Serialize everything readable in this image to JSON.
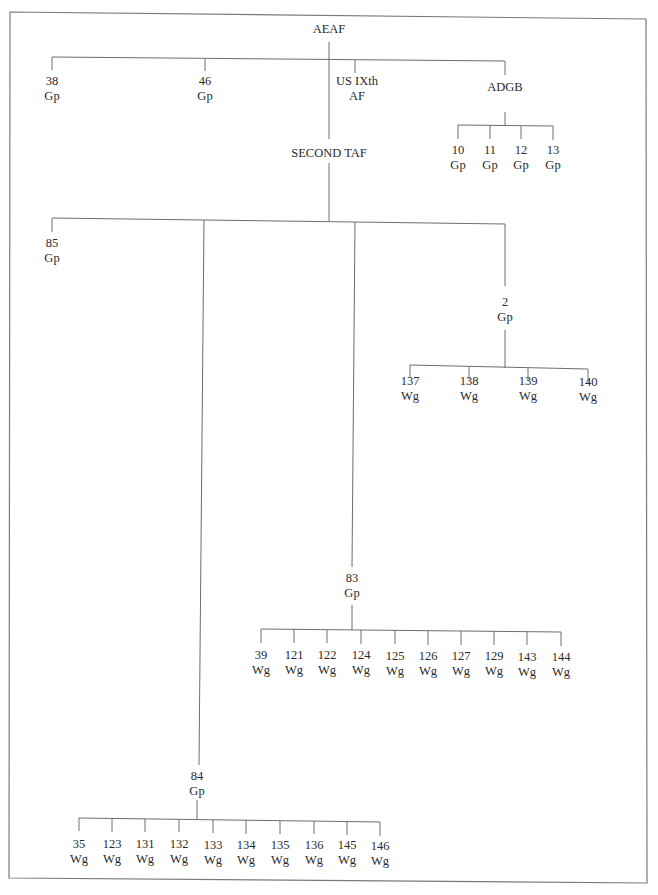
{
  "diagram": {
    "type": "organization-chart",
    "root": {
      "id": "aeaf",
      "lines": [
        "AEAF"
      ],
      "x": 329,
      "y": 22,
      "children": [
        {
          "id": "38-gp",
          "lines": [
            "38",
            "Gp"
          ],
          "x": 52,
          "y": 74
        },
        {
          "id": "46-gp",
          "lines": [
            "46",
            "Gp"
          ],
          "x": 205,
          "y": 74
        },
        {
          "id": "us-ixth-af",
          "lines": [
            "US IXth",
            "AF"
          ],
          "x": 357,
          "y": 74
        },
        {
          "id": "adgb",
          "lines": [
            "ADGB"
          ],
          "x": 505,
          "y": 80,
          "children": [
            {
              "id": "10-gp",
              "lines": [
                "10",
                "Gp"
              ],
              "x": 458,
              "y": 143
            },
            {
              "id": "11-gp",
              "lines": [
                "11",
                "Gp"
              ],
              "x": 490,
              "y": 143
            },
            {
              "id": "12-gp",
              "lines": [
                "12",
                "Gp"
              ],
              "x": 521,
              "y": 143
            },
            {
              "id": "13-gp",
              "lines": [
                "13",
                "Gp"
              ],
              "x": 553,
              "y": 143
            }
          ]
        },
        {
          "id": "second-taf",
          "lines": [
            "SECOND TAF"
          ],
          "x": 329,
          "y": 146,
          "children": [
            {
              "id": "85-gp",
              "lines": [
                "85",
                "Gp"
              ],
              "x": 52,
              "y": 236
            },
            {
              "id": "2-gp",
              "lines": [
                "2",
                "Gp"
              ],
              "x": 505,
              "y": 295,
              "children": [
                {
                  "id": "137-wg",
                  "lines": [
                    "137",
                    "Wg"
                  ],
                  "x": 410,
                  "y": 374
                },
                {
                  "id": "138-wg",
                  "lines": [
                    "138",
                    "Wg"
                  ],
                  "x": 469,
                  "y": 374
                },
                {
                  "id": "139-wg",
                  "lines": [
                    "139",
                    "Wg"
                  ],
                  "x": 528,
                  "y": 374
                },
                {
                  "id": "140-wg",
                  "lines": [
                    "140",
                    "Wg"
                  ],
                  "x": 588,
                  "y": 375
                }
              ]
            },
            {
              "id": "83-gp",
              "lines": [
                "83",
                "Gp"
              ],
              "x": 352,
              "y": 571,
              "children": [
                {
                  "id": "39-wg",
                  "lines": [
                    "39",
                    "Wg"
                  ],
                  "x": 261,
                  "y": 648
                },
                {
                  "id": "121-wg",
                  "lines": [
                    "121",
                    "Wg"
                  ],
                  "x": 294,
                  "y": 648
                },
                {
                  "id": "122-wg",
                  "lines": [
                    "122",
                    "Wg"
                  ],
                  "x": 327,
                  "y": 648
                },
                {
                  "id": "124-wg",
                  "lines": [
                    "124",
                    "Wg"
                  ],
                  "x": 361,
                  "y": 648
                },
                {
                  "id": "125-wg",
                  "lines": [
                    "125",
                    "Wg"
                  ],
                  "x": 395,
                  "y": 649
                },
                {
                  "id": "126-wg",
                  "lines": [
                    "126",
                    "Wg"
                  ],
                  "x": 428,
                  "y": 649
                },
                {
                  "id": "127-wg",
                  "lines": [
                    "127",
                    "Wg"
                  ],
                  "x": 461,
                  "y": 649
                },
                {
                  "id": "129-wg",
                  "lines": [
                    "129",
                    "Wg"
                  ],
                  "x": 494,
                  "y": 649
                },
                {
                  "id": "143-wg",
                  "lines": [
                    "143",
                    "Wg"
                  ],
                  "x": 527,
                  "y": 650
                },
                {
                  "id": "144-wg",
                  "lines": [
                    "144",
                    "Wg"
                  ],
                  "x": 561,
                  "y": 650
                }
              ]
            },
            {
              "id": "84-gp",
              "lines": [
                "84",
                "Gp"
              ],
              "x": 197,
              "y": 769,
              "children": [
                {
                  "id": "35-wg",
                  "lines": [
                    "35",
                    "Wg"
                  ],
                  "x": 79,
                  "y": 837
                },
                {
                  "id": "123-wg",
                  "lines": [
                    "123",
                    "Wg"
                  ],
                  "x": 112,
                  "y": 837
                },
                {
                  "id": "131-wg",
                  "lines": [
                    "131",
                    "Wg"
                  ],
                  "x": 145,
                  "y": 837
                },
                {
                  "id": "132-wg",
                  "lines": [
                    "132",
                    "Wg"
                  ],
                  "x": 179,
                  "y": 837
                },
                {
                  "id": "133-wg",
                  "lines": [
                    "133",
                    "Wg"
                  ],
                  "x": 213,
                  "y": 838
                },
                {
                  "id": "134-wg",
                  "lines": [
                    "134",
                    "Wg"
                  ],
                  "x": 246,
                  "y": 838
                },
                {
                  "id": "135-wg",
                  "lines": [
                    "135",
                    "Wg"
                  ],
                  "x": 280,
                  "y": 838
                },
                {
                  "id": "136-wg",
                  "lines": [
                    "136",
                    "Wg"
                  ],
                  "x": 314,
                  "y": 838
                },
                {
                  "id": "145-wg",
                  "lines": [
                    "145",
                    "Wg"
                  ],
                  "x": 347,
                  "y": 838
                },
                {
                  "id": "146-wg",
                  "lines": [
                    "146",
                    "Wg"
                  ],
                  "x": 380,
                  "y": 839
                }
              ]
            }
          ]
        }
      ]
    },
    "connectors": [
      {
        "name": "aeaf-to-second-taf-trunk",
        "x1": 329,
        "y1": 42,
        "x2": 329,
        "y2": 139
      },
      {
        "name": "aeaf-children-bar",
        "x1": 52,
        "y1": 57,
        "x2": 505,
        "y2": 61
      },
      {
        "name": "tick-38-gp",
        "x1": 52,
        "y1": 57,
        "x2": 52,
        "y2": 70
      },
      {
        "name": "tick-46-gp",
        "x1": 205,
        "y1": 58,
        "x2": 205,
        "y2": 71
      },
      {
        "name": "tick-us-ixth-af",
        "x1": 355,
        "y1": 60,
        "x2": 355,
        "y2": 73
      },
      {
        "name": "tick-adgb",
        "x1": 505,
        "y1": 61,
        "x2": 505,
        "y2": 75
      },
      {
        "name": "adgb-stem",
        "x1": 505,
        "y1": 112,
        "x2": 505,
        "y2": 126
      },
      {
        "name": "adgb-children-bar",
        "x1": 458,
        "y1": 125,
        "x2": 553,
        "y2": 126
      },
      {
        "name": "tick-10-gp",
        "x1": 458,
        "y1": 125,
        "x2": 458,
        "y2": 139
      },
      {
        "name": "tick-11-gp",
        "x1": 490,
        "y1": 125,
        "x2": 490,
        "y2": 139
      },
      {
        "name": "tick-12-gp",
        "x1": 521,
        "y1": 126,
        "x2": 521,
        "y2": 139
      },
      {
        "name": "tick-13-gp",
        "x1": 553,
        "y1": 126,
        "x2": 553,
        "y2": 140
      },
      {
        "name": "second-taf-stem",
        "x1": 329,
        "y1": 163,
        "x2": 329,
        "y2": 221
      },
      {
        "name": "second-taf-children-bar",
        "x1": 52,
        "y1": 218,
        "x2": 505,
        "y2": 224
      },
      {
        "name": "tick-85-gp",
        "x1": 52,
        "y1": 218,
        "x2": 52,
        "y2": 232
      },
      {
        "name": "line-to-84-gp",
        "x1": 204,
        "y1": 220,
        "x2": 199,
        "y2": 765
      },
      {
        "name": "line-to-83-gp",
        "x1": 355,
        "y1": 222,
        "x2": 352,
        "y2": 567
      },
      {
        "name": "tick-2-gp",
        "x1": 505,
        "y1": 224,
        "x2": 505,
        "y2": 286
      },
      {
        "name": "2-gp-stem",
        "x1": 505,
        "y1": 330,
        "x2": 505,
        "y2": 368
      },
      {
        "name": "2-gp-children-bar",
        "x1": 410,
        "y1": 365,
        "x2": 588,
        "y2": 369
      },
      {
        "name": "tick-137-wg",
        "x1": 410,
        "y1": 365,
        "x2": 410,
        "y2": 378
      },
      {
        "name": "tick-138-wg",
        "x1": 469,
        "y1": 366,
        "x2": 469,
        "y2": 379
      },
      {
        "name": "tick-139-wg",
        "x1": 528,
        "y1": 368,
        "x2": 528,
        "y2": 381
      },
      {
        "name": "tick-140-wg",
        "x1": 588,
        "y1": 369,
        "x2": 588,
        "y2": 383
      },
      {
        "name": "83-gp-stem",
        "x1": 352,
        "y1": 605,
        "x2": 352,
        "y2": 630
      },
      {
        "name": "83-gp-children-bar",
        "x1": 261,
        "y1": 629,
        "x2": 561,
        "y2": 632
      },
      {
        "name": "tick-39-wg",
        "x1": 261,
        "y1": 629,
        "x2": 261,
        "y2": 643
      },
      {
        "name": "tick-121-wg",
        "x1": 294,
        "y1": 629,
        "x2": 294,
        "y2": 643
      },
      {
        "name": "tick-122-wg",
        "x1": 327,
        "y1": 630,
        "x2": 327,
        "y2": 643
      },
      {
        "name": "tick-124-wg",
        "x1": 361,
        "y1": 630,
        "x2": 361,
        "y2": 644
      },
      {
        "name": "tick-125-wg",
        "x1": 395,
        "y1": 630,
        "x2": 395,
        "y2": 644
      },
      {
        "name": "tick-126-wg",
        "x1": 428,
        "y1": 631,
        "x2": 428,
        "y2": 645
      },
      {
        "name": "tick-127-wg",
        "x1": 461,
        "y1": 631,
        "x2": 461,
        "y2": 645
      },
      {
        "name": "tick-129-wg",
        "x1": 494,
        "y1": 631,
        "x2": 494,
        "y2": 645
      },
      {
        "name": "tick-143-wg",
        "x1": 527,
        "y1": 632,
        "x2": 527,
        "y2": 645
      },
      {
        "name": "tick-144-wg",
        "x1": 561,
        "y1": 632,
        "x2": 561,
        "y2": 646
      },
      {
        "name": "84-gp-stem",
        "x1": 197,
        "y1": 800,
        "x2": 197,
        "y2": 820
      },
      {
        "name": "84-gp-children-bar",
        "x1": 79,
        "y1": 818,
        "x2": 380,
        "y2": 822
      },
      {
        "name": "tick-35-wg",
        "x1": 79,
        "y1": 818,
        "x2": 79,
        "y2": 831
      },
      {
        "name": "tick-123-wg",
        "x1": 112,
        "y1": 819,
        "x2": 112,
        "y2": 832
      },
      {
        "name": "tick-131-wg",
        "x1": 145,
        "y1": 819,
        "x2": 145,
        "y2": 832
      },
      {
        "name": "tick-132-wg",
        "x1": 179,
        "y1": 819,
        "x2": 179,
        "y2": 832
      },
      {
        "name": "tick-133-wg",
        "x1": 213,
        "y1": 820,
        "x2": 213,
        "y2": 833
      },
      {
        "name": "tick-134-wg",
        "x1": 246,
        "y1": 820,
        "x2": 246,
        "y2": 834
      },
      {
        "name": "tick-135-wg",
        "x1": 280,
        "y1": 821,
        "x2": 280,
        "y2": 834
      },
      {
        "name": "tick-136-wg",
        "x1": 314,
        "y1": 821,
        "x2": 314,
        "y2": 834
      },
      {
        "name": "tick-145-wg",
        "x1": 347,
        "y1": 821,
        "x2": 347,
        "y2": 835
      },
      {
        "name": "tick-146-wg",
        "x1": 380,
        "y1": 822,
        "x2": 380,
        "y2": 836
      }
    ],
    "frame": {
      "points": "10,12 646,19 647,883 9,878",
      "stroke": "#7a7a7a"
    },
    "colors": {
      "line": "#6e6e6e",
      "text": "#2a2a2a",
      "background": "#ffffff"
    }
  }
}
